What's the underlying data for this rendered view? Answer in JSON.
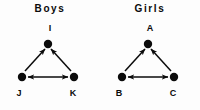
{
  "figure": {
    "background_color": "#fdfdfd",
    "ink_color": "#0b0b0b"
  },
  "panels": [
    {
      "title": "Boys",
      "nodes": {
        "top": "I",
        "bottom_left": "J",
        "bottom_right": "K"
      },
      "edges": [
        {
          "from": "J",
          "to": "I",
          "style": "single-arrow"
        },
        {
          "from": "K",
          "to": "I",
          "style": "single-arrow"
        },
        {
          "from": "J",
          "to": "K",
          "style": "double-arrow"
        }
      ]
    },
    {
      "title": "Girls",
      "nodes": {
        "top": "A",
        "bottom_left": "B",
        "bottom_right": "C"
      },
      "edges": [
        {
          "from": "B",
          "to": "A",
          "style": "single-arrow"
        },
        {
          "from": "C",
          "to": "A",
          "style": "single-arrow"
        },
        {
          "from": "B",
          "to": "C",
          "style": "double-arrow"
        }
      ]
    }
  ]
}
